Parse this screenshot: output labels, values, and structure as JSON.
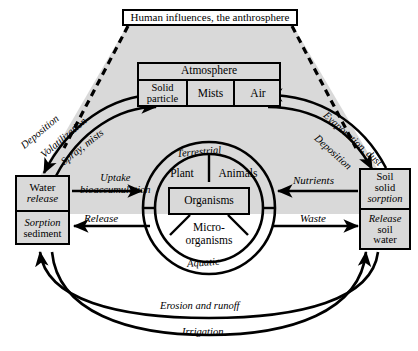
{
  "diagram": {
    "colors": {
      "shading": "#d9d9d9",
      "stroke": "#000000",
      "page": "#ffffff"
    },
    "anthrosphere": {
      "label": "Human influences, the anthrosphere",
      "connector_style": "dashed"
    },
    "atmosphere": {
      "header": "Atmosphere",
      "cells": [
        {
          "label": "Solid particle"
        },
        {
          "label": "Mists"
        },
        {
          "label": "Air"
        }
      ]
    },
    "water_compartment": {
      "rows": [
        {
          "line1": "Water",
          "line2": "release"
        },
        {
          "line1": "Sorption",
          "line2": "sediment"
        }
      ],
      "internal_arrow": "double-vertical"
    },
    "soil_compartment": {
      "rows": [
        {
          "line1": "Soil",
          "line2": "solid",
          "line3": "sorption"
        },
        {
          "line1": "Release",
          "line2": "soil",
          "line3": "water"
        }
      ],
      "internal_arrow": "double-vertical"
    },
    "biosphere": {
      "outer_ring_labels": {
        "top": "Terrestrial",
        "bottom": "Aquatic"
      },
      "sectors": [
        {
          "label": "Plant"
        },
        {
          "label": "Animals"
        },
        {
          "label": "Micro-organisms",
          "line1": "Micro-",
          "line2": "organisms"
        }
      ],
      "core": {
        "label": "Organisms"
      }
    },
    "flows": [
      {
        "name": "deposition-left",
        "label": "Deposition",
        "direction": "atmosphere-to-water"
      },
      {
        "name": "volatilization",
        "label": "Volatilization",
        "direction": "water-to-atmosphere"
      },
      {
        "name": "spray-mists",
        "label": "Spray, mists",
        "direction": "water-to-atmosphere"
      },
      {
        "name": "evaporation-dust",
        "label": "Evaporation, dust",
        "direction": "soil-to-atmosphere"
      },
      {
        "name": "deposition-right",
        "label": "Deposition",
        "direction": "atmosphere-to-soil"
      },
      {
        "name": "uptake",
        "label": "Uptake bioaccumulation",
        "line1": "Uptake",
        "line2": "bioaccumulation",
        "direction": "water-to-organisms"
      },
      {
        "name": "release",
        "label": "Release",
        "direction": "organisms-to-water"
      },
      {
        "name": "nutrients",
        "label": "Nutrients",
        "direction": "soil-to-organisms"
      },
      {
        "name": "waste",
        "label": "Waste",
        "direction": "organisms-to-soil"
      },
      {
        "name": "erosion-and-runoff",
        "label": "Erosion and runoff",
        "direction": "soil-to-water"
      },
      {
        "name": "irrigation",
        "label": "Irrigation",
        "direction": "water-to-soil"
      }
    ]
  }
}
